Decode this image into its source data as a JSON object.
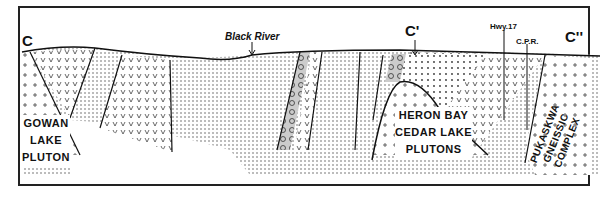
{
  "section_labels": {
    "start": "C",
    "middle": "C'",
    "end": "C''"
  },
  "features": {
    "river": "Black River",
    "highway": "Hwy.17",
    "railway": "C.P.R."
  },
  "units": {
    "gowan": [
      "GOWAN",
      "LAKE",
      "PLUTON"
    ],
    "heron": [
      "HERON BAY",
      "CEDAR LAKE",
      "PLUTONS"
    ],
    "pukaskwa": [
      "PUKASKWA",
      "GNEISSIC",
      "COMPLEX"
    ]
  }
}
